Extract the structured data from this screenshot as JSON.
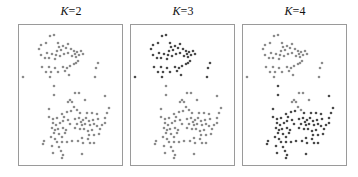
{
  "chart_data": {
    "type": "scatter",
    "panels": [
      {
        "label_var": "K",
        "label_eq": "=2",
        "k": 2,
        "left": 18
      },
      {
        "label_var": "K",
        "label_eq": "=3",
        "k": 3,
        "left": 130
      },
      {
        "label_var": "K",
        "label_eq": "=4",
        "k": 4,
        "left": 242
      }
    ],
    "axes": {
      "grid": false,
      "ticks": false
    },
    "colors": {
      "light": "#8c8c8c",
      "dark": "#4a4a4a",
      "frame": "#9a9a9a"
    },
    "points": [
      [
        31,
        7,
        "a"
      ],
      [
        35,
        6,
        "a"
      ],
      [
        22,
        16,
        "a"
      ],
      [
        27,
        14,
        "a"
      ],
      [
        20,
        20,
        "a"
      ],
      [
        39,
        14,
        "a"
      ],
      [
        40,
        18,
        "a"
      ],
      [
        44,
        17,
        "a"
      ],
      [
        49,
        15,
        "a"
      ],
      [
        38,
        22,
        "a"
      ],
      [
        42,
        21,
        "a"
      ],
      [
        47,
        19,
        "a"
      ],
      [
        52,
        20,
        "a"
      ],
      [
        55,
        22,
        "a"
      ],
      [
        58,
        23,
        "a"
      ],
      [
        62,
        22,
        "a"
      ],
      [
        60,
        26,
        "a"
      ],
      [
        64,
        25,
        "a"
      ],
      [
        56,
        25,
        "a"
      ],
      [
        28,
        24,
        "a"
      ],
      [
        33,
        25,
        "a"
      ],
      [
        37,
        26,
        "a"
      ],
      [
        41,
        27,
        "a"
      ],
      [
        45,
        25,
        "a"
      ],
      [
        49,
        24,
        "a"
      ],
      [
        53,
        27,
        "a"
      ],
      [
        57,
        28,
        "a"
      ],
      [
        22,
        26,
        "a"
      ],
      [
        26,
        29,
        "a"
      ],
      [
        30,
        29,
        "a"
      ],
      [
        36,
        30,
        "a"
      ],
      [
        59,
        32,
        "a"
      ],
      [
        57,
        34,
        "a"
      ],
      [
        55,
        35,
        "a"
      ],
      [
        23,
        38,
        "a"
      ],
      [
        30,
        38,
        "a"
      ],
      [
        36,
        39,
        "a"
      ],
      [
        44,
        38,
        "a"
      ],
      [
        48,
        39,
        "a"
      ],
      [
        51,
        37,
        "a"
      ],
      [
        27,
        43,
        "a"
      ],
      [
        32,
        43,
        "a"
      ],
      [
        39,
        43,
        "a"
      ],
      [
        50,
        46,
        "a"
      ],
      [
        46,
        42,
        "a"
      ],
      [
        31,
        48,
        "a"
      ],
      [
        4,
        48,
        "a"
      ],
      [
        79,
        34,
        "a"
      ],
      [
        77,
        39,
        "a"
      ],
      [
        76,
        48,
        "a"
      ],
      [
        35,
        57,
        "b"
      ],
      [
        35,
        66,
        "b"
      ],
      [
        56,
        64,
        "b"
      ],
      [
        60,
        64,
        "b"
      ],
      [
        49,
        73,
        "b"
      ],
      [
        53,
        73,
        "b"
      ],
      [
        51,
        71,
        "b"
      ],
      [
        55,
        78,
        "b"
      ],
      [
        58,
        81,
        "b"
      ],
      [
        66,
        71,
        "b"
      ],
      [
        86,
        67,
        "b"
      ],
      [
        90,
        79,
        "b"
      ],
      [
        30,
        80,
        "b"
      ],
      [
        43,
        85,
        "b"
      ],
      [
        48,
        83,
        "b"
      ],
      [
        52,
        82,
        "b"
      ],
      [
        61,
        84,
        "b"
      ],
      [
        68,
        84,
        "b"
      ],
      [
        73,
        84,
        "b"
      ],
      [
        78,
        85,
        "b"
      ],
      [
        30,
        88,
        "b"
      ],
      [
        34,
        90,
        "b"
      ],
      [
        38,
        89,
        "b"
      ],
      [
        45,
        88,
        "b"
      ],
      [
        49,
        91,
        "b"
      ],
      [
        56,
        90,
        "b"
      ],
      [
        60,
        89,
        "b"
      ],
      [
        64,
        91,
        "b"
      ],
      [
        67,
        89,
        "b"
      ],
      [
        70,
        92,
        "b"
      ],
      [
        74,
        91,
        "b"
      ],
      [
        79,
        90,
        "b"
      ],
      [
        86,
        89,
        "b"
      ],
      [
        88,
        84,
        "b"
      ],
      [
        34,
        94,
        "b"
      ],
      [
        37,
        96,
        "b"
      ],
      [
        41,
        94,
        "b"
      ],
      [
        44,
        92,
        "b"
      ],
      [
        51,
        95,
        "b"
      ],
      [
        58,
        95,
        "b"
      ],
      [
        62,
        93,
        "b"
      ],
      [
        63,
        96,
        "b"
      ],
      [
        66,
        95,
        "b"
      ],
      [
        71,
        96,
        "b"
      ],
      [
        75,
        95,
        "b"
      ],
      [
        78,
        97,
        "b"
      ],
      [
        83,
        96,
        "b"
      ],
      [
        86,
        94,
        "b"
      ],
      [
        33,
        99,
        "b"
      ],
      [
        36,
        101,
        "b"
      ],
      [
        39,
        100,
        "b"
      ],
      [
        44,
        99,
        "b"
      ],
      [
        47,
        101,
        "b"
      ],
      [
        56,
        99,
        "b"
      ],
      [
        61,
        100,
        "b"
      ],
      [
        65,
        100,
        "b"
      ],
      [
        69,
        102,
        "b"
      ],
      [
        73,
        101,
        "b"
      ],
      [
        81,
        100,
        "b"
      ],
      [
        35,
        104,
        "b"
      ],
      [
        40,
        105,
        "b"
      ],
      [
        46,
        104,
        "b"
      ],
      [
        70,
        106,
        "b"
      ],
      [
        75,
        106,
        "b"
      ],
      [
        80,
        105,
        "b"
      ],
      [
        32,
        108,
        "b"
      ],
      [
        36,
        110,
        "b"
      ],
      [
        43,
        108,
        "b"
      ],
      [
        63,
        109,
        "b"
      ],
      [
        69,
        110,
        "b"
      ],
      [
        25,
        112,
        "b"
      ],
      [
        24,
        115,
        "b"
      ],
      [
        38,
        113,
        "b"
      ],
      [
        43,
        113,
        "b"
      ],
      [
        48,
        113,
        "b"
      ],
      [
        53,
        112,
        "b"
      ],
      [
        59,
        112,
        "b"
      ],
      [
        64,
        114,
        "b"
      ],
      [
        71,
        114,
        "b"
      ],
      [
        75,
        114,
        "b"
      ],
      [
        33,
        117,
        "b"
      ],
      [
        40,
        118,
        "b"
      ],
      [
        34,
        124,
        "b"
      ],
      [
        42,
        122,
        "b"
      ],
      [
        44,
        126,
        "b"
      ],
      [
        43,
        129,
        "b"
      ],
      [
        63,
        125,
        "b"
      ]
    ]
  }
}
